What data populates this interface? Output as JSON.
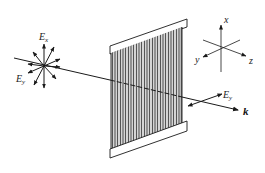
{
  "diagram": {
    "input_field": {
      "label_Ex_main": "E",
      "label_Ex_sub": "x",
      "label_Ey_main": "E",
      "label_Ey_sub": "y",
      "description": "unpolarized light: electric field vectors in all directions"
    },
    "polarizer": {
      "description": "wire-grid polarizer with vertical wires"
    },
    "output_field": {
      "label_Ey_main": "E",
      "label_Ey_sub": "y"
    },
    "wave_vector": {
      "label": "k"
    },
    "axes": {
      "x_label": "x",
      "y_label": "y",
      "z_label": "z"
    },
    "colors": {
      "stroke": "#1a1a1a",
      "grid_dark": "#555555",
      "grid_light": "#dcdcdc",
      "background": "#ffffff"
    }
  }
}
